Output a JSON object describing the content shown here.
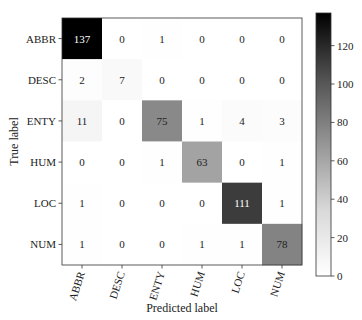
{
  "chart_data": {
    "type": "heatmap",
    "title": "",
    "xlabel": "Predicted label",
    "ylabel": "True label",
    "x_categories": [
      "ABBR",
      "DESC",
      "ENTY",
      "HUM",
      "LOC",
      "NUM"
    ],
    "y_categories": [
      "ABBR",
      "DESC",
      "ENTY",
      "HUM",
      "LOC",
      "NUM"
    ],
    "matrix": [
      [
        137,
        0,
        1,
        0,
        0,
        0
      ],
      [
        2,
        7,
        0,
        0,
        0,
        0
      ],
      [
        11,
        0,
        75,
        1,
        4,
        3
      ],
      [
        0,
        0,
        1,
        63,
        0,
        1
      ],
      [
        1,
        0,
        0,
        0,
        111,
        1
      ],
      [
        1,
        0,
        0,
        1,
        1,
        78
      ]
    ],
    "colormap": "Greys",
    "color_range": [
      0,
      137
    ],
    "colorbar": {
      "ticks": [
        0,
        20,
        40,
        60,
        80,
        100,
        120
      ],
      "placement": "right"
    },
    "xtick_rotation": "rotated ~70°"
  }
}
